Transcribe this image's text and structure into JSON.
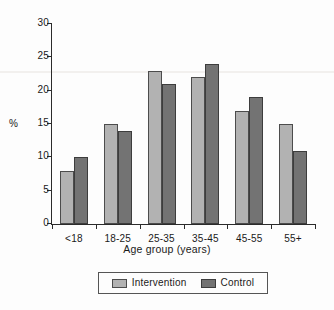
{
  "chart_data": {
    "type": "bar",
    "title": "",
    "subtitle": "",
    "xlabel": "Age group (years)",
    "ylabel": "%",
    "categories": [
      "<18",
      "18-25",
      "25-35",
      "35-45",
      "45-55",
      "55+"
    ],
    "series": [
      {
        "name": "Intervention",
        "color": "#b2b2b2",
        "values": [
          8,
          15,
          23,
          22,
          17,
          15
        ]
      },
      {
        "name": "Control",
        "color": "#737373",
        "values": [
          10,
          14,
          21,
          24,
          19,
          11
        ]
      }
    ],
    "ylim": [
      0,
      30
    ],
    "yticks": [
      0,
      5,
      10,
      15,
      20,
      25,
      30
    ],
    "ytick_labels": [
      "0",
      "5",
      "10",
      "15",
      "20",
      "25",
      "30"
    ],
    "grid": false,
    "legend_position": "bottom-center",
    "legend_entries": [
      "Intervention",
      "Control"
    ]
  },
  "figure": {
    "background": "#fdfdfd",
    "axis_color": "#2b2b2b"
  }
}
